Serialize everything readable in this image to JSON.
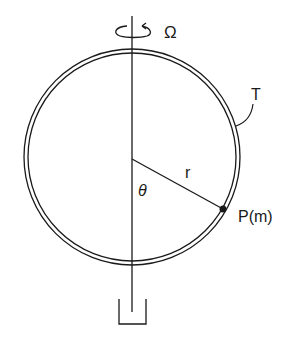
{
  "diagram": {
    "labels": {
      "omega": "Ω",
      "tube": "T",
      "radius": "r",
      "angle": "θ",
      "point": "P(m)"
    },
    "colors": {
      "ink": "#1a1a1a",
      "background": "#ffffff"
    },
    "geometry": {
      "center": [
        132,
        157
      ],
      "outer_radius": 108,
      "inner_radius": 104,
      "point_position": [
        223,
        209
      ]
    }
  }
}
